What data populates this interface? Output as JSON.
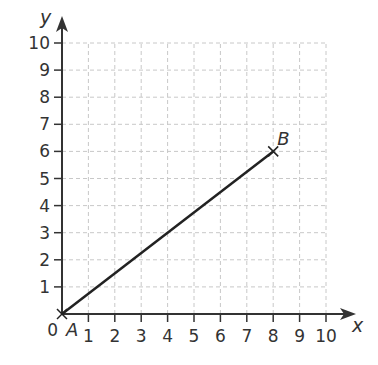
{
  "chart_data": {
    "type": "line",
    "title": "",
    "xlabel": "x",
    "ylabel": "y",
    "xlim": [
      0,
      10
    ],
    "ylim": [
      0,
      10
    ],
    "x_ticks": [
      1,
      2,
      3,
      4,
      5,
      6,
      7,
      8,
      9,
      10
    ],
    "y_ticks": [
      1,
      2,
      3,
      4,
      5,
      6,
      7,
      8,
      9,
      10
    ],
    "origin_label": "0",
    "grid": true,
    "grid_style": "dashed",
    "series": [
      {
        "name": "segment AB",
        "points": [
          {
            "label": "A",
            "x": 0,
            "y": 0
          },
          {
            "label": "B",
            "x": 8,
            "y": 6
          }
        ]
      }
    ],
    "annotations": [
      {
        "text": "A",
        "x": 0,
        "y": 0
      },
      {
        "text": "B",
        "x": 8,
        "y": 6
      }
    ]
  },
  "colors": {
    "axis": "#333333",
    "grid": "#c8c8c8",
    "line": "#222222",
    "text": "#333333"
  }
}
